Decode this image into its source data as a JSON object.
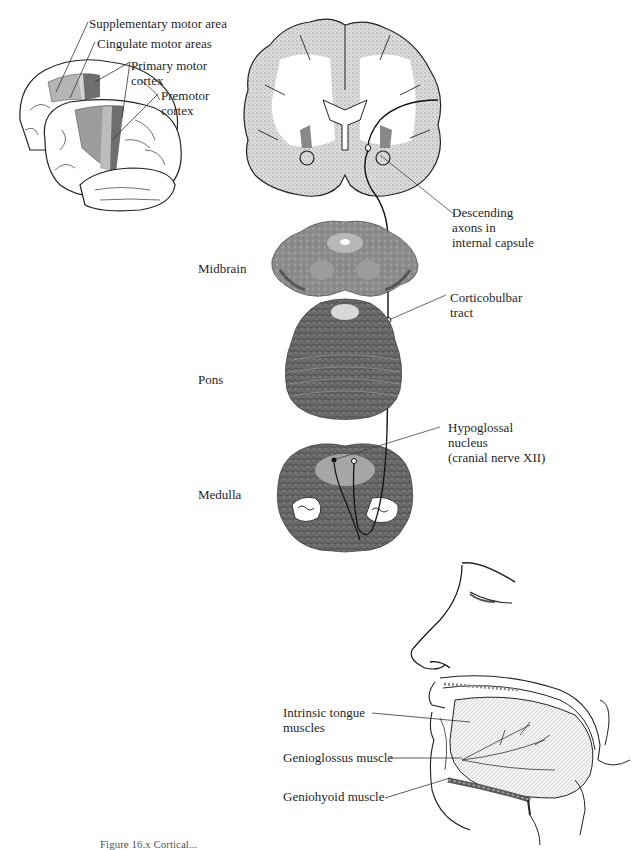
{
  "figure": {
    "type": "anatomical-diagram",
    "caption_partial": "Figure 16.x  Cortical..."
  },
  "brain_lateral_view": {
    "labels": [
      {
        "id": "sma",
        "lines": [
          "Supplementary motor area"
        ]
      },
      {
        "id": "cma",
        "lines": [
          "Cingulate motor areas"
        ]
      },
      {
        "id": "m1",
        "lines": [
          "Primary motor",
          "cortex"
        ]
      },
      {
        "id": "pmc",
        "lines": [
          "Premotor",
          "cortex"
        ]
      }
    ],
    "colors": {
      "primary_motor": "#6e6e6e",
      "premotor": "#9c9c9c",
      "sma": "#b5b5b5"
    }
  },
  "coronal_section": {
    "labels": [
      {
        "id": "internal-capsule",
        "lines": [
          "Descending",
          "axons in",
          "internal capsule"
        ]
      }
    ]
  },
  "brainstem": {
    "levels": [
      {
        "id": "midbrain",
        "label": "Midbrain"
      },
      {
        "id": "pons",
        "label": "Pons"
      },
      {
        "id": "medulla",
        "label": "Medulla"
      }
    ],
    "labels": [
      {
        "id": "corticobulbar",
        "lines": [
          "Corticobulbar",
          "tract"
        ]
      },
      {
        "id": "hypoglossal",
        "lines": [
          "Hypoglossal",
          "nucleus",
          "(cranial nerve XII)"
        ]
      }
    ]
  },
  "tongue_view": {
    "labels": [
      {
        "id": "intrinsic",
        "lines": [
          "Intrinsic tongue",
          "muscles"
        ]
      },
      {
        "id": "genioglossus",
        "lines": [
          "Genioglossus muscle"
        ]
      },
      {
        "id": "geniohyoid",
        "lines": [
          "Geniohyoid muscle"
        ]
      }
    ]
  }
}
